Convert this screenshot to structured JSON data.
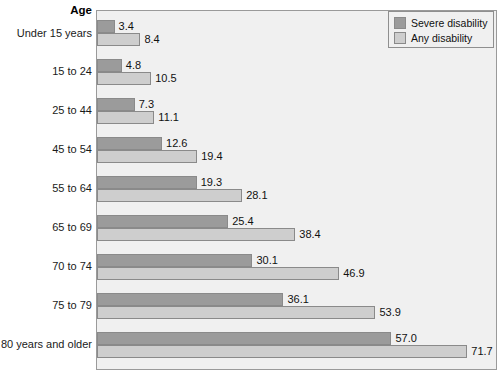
{
  "chart_data": {
    "type": "bar",
    "orientation": "horizontal",
    "title": "",
    "xlabel": "",
    "ylabel": "Age",
    "axis_title": "Age",
    "categories": [
      "Under 15 years",
      "15 to 24",
      "25 to 44",
      "45 to 54",
      "55 to 64",
      "65 to 69",
      "70 to 74",
      "75 to 79",
      "80 years and older"
    ],
    "series": [
      {
        "name": "Severe disability",
        "color": "#9b9b9b",
        "values": [
          3.4,
          4.8,
          7.3,
          12.6,
          19.3,
          25.4,
          30.1,
          36.1,
          57.0
        ],
        "labels": [
          "3.4",
          "4.8",
          "7.3",
          "12.6",
          "19.3",
          "25.4",
          "30.1",
          "36.1",
          "57.0"
        ]
      },
      {
        "name": "Any disability",
        "color": "#cecece",
        "values": [
          8.4,
          10.5,
          11.1,
          19.4,
          28.1,
          38.4,
          46.9,
          53.9,
          71.7
        ],
        "labels": [
          "8.4",
          "10.5",
          "11.1",
          "19.4",
          "28.1",
          "38.4",
          "46.9",
          "53.9",
          "71.7"
        ]
      }
    ],
    "xlim": [
      0,
      77.6
    ],
    "grid": false,
    "legend_position": "top-right",
    "plot_background": "#f0f0f0",
    "value_label_precision": 1
  },
  "legend": {
    "items": [
      {
        "label": "Severe disability",
        "color": "#9b9b9b"
      },
      {
        "label": "Any disability",
        "color": "#cecece"
      }
    ]
  }
}
